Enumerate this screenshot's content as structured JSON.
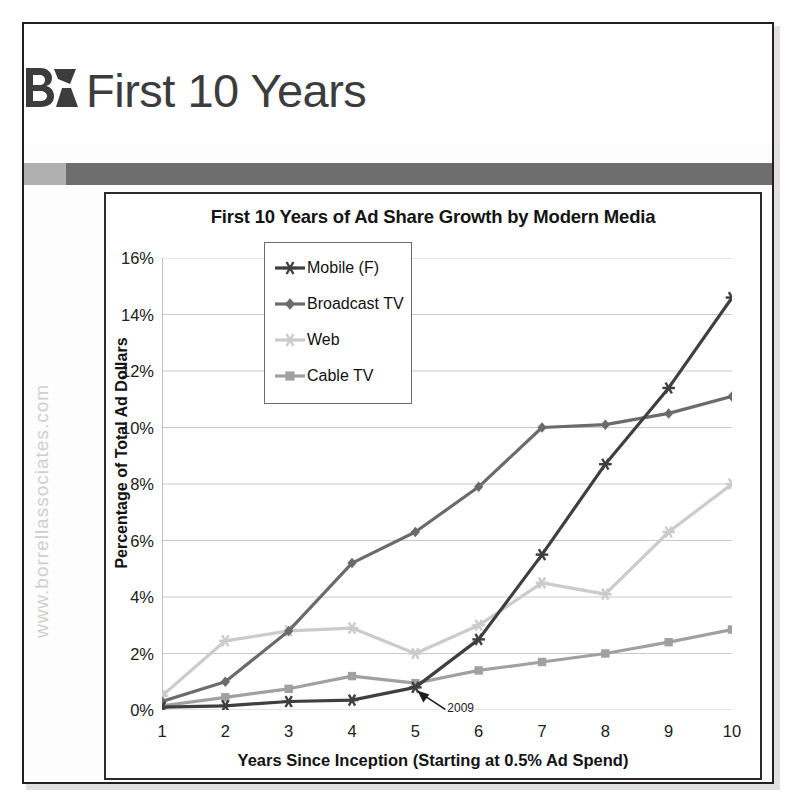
{
  "page": {
    "width": 794,
    "height": 808,
    "background": "#ffffff"
  },
  "header": {
    "title": "First 10 Years",
    "logo_text": "BA",
    "logo_name": "borrell-associates-logo"
  },
  "watermark": {
    "text": "www.borrellassociates.com"
  },
  "divider": {
    "light_color": "#b0b0b0",
    "dark_color": "#6e6e6e"
  },
  "chart_data": {
    "type": "line",
    "title": "First 10 Years of Ad Share Growth by Modern Media",
    "xlabel": "Years Since Inception (Starting at 0.5% Ad Spend)",
    "ylabel": "Percentage of Total Ad Dollars",
    "x": [
      1,
      2,
      3,
      4,
      5,
      6,
      7,
      8,
      9,
      10
    ],
    "xtick_labels": [
      "1",
      "2",
      "3",
      "4",
      "5",
      "6",
      "7",
      "8",
      "9",
      "10"
    ],
    "ytick_labels": [
      "0%",
      "2%",
      "4%",
      "6%",
      "8%",
      "10%",
      "12%",
      "14%",
      "16%"
    ],
    "ytick_values": [
      0,
      2,
      4,
      6,
      8,
      10,
      12,
      14,
      16
    ],
    "xlim": [
      1,
      10
    ],
    "ylim": [
      0,
      16
    ],
    "grid": "horizontal",
    "legend_position": "upper-left-inside",
    "series": [
      {
        "name": "Mobile (F)",
        "color": "#3f3f3f",
        "marker": "star",
        "values": [
          0.1,
          0.15,
          0.3,
          0.35,
          0.8,
          2.5,
          5.5,
          8.7,
          11.4,
          14.6
        ]
      },
      {
        "name": "Broadcast TV",
        "color": "#6b6b6b",
        "marker": "diamond",
        "values": [
          0.3,
          1.0,
          2.8,
          5.2,
          6.3,
          7.9,
          10.0,
          10.1,
          10.5,
          11.1
        ]
      },
      {
        "name": "Web",
        "color": "#cbcbcb",
        "marker": "star",
        "values": [
          0.5,
          2.45,
          2.8,
          2.9,
          2.0,
          3.0,
          4.5,
          4.1,
          6.3,
          8.0
        ]
      },
      {
        "name": "Cable TV",
        "color": "#a0a0a0",
        "marker": "square",
        "values": [
          0.15,
          0.45,
          0.75,
          1.2,
          0.95,
          1.4,
          1.7,
          2.0,
          2.4,
          2.85
        ]
      }
    ],
    "annotations": [
      {
        "text": "2009",
        "x": 5,
        "y": 0.8,
        "label": "annotation-2009"
      }
    ]
  }
}
